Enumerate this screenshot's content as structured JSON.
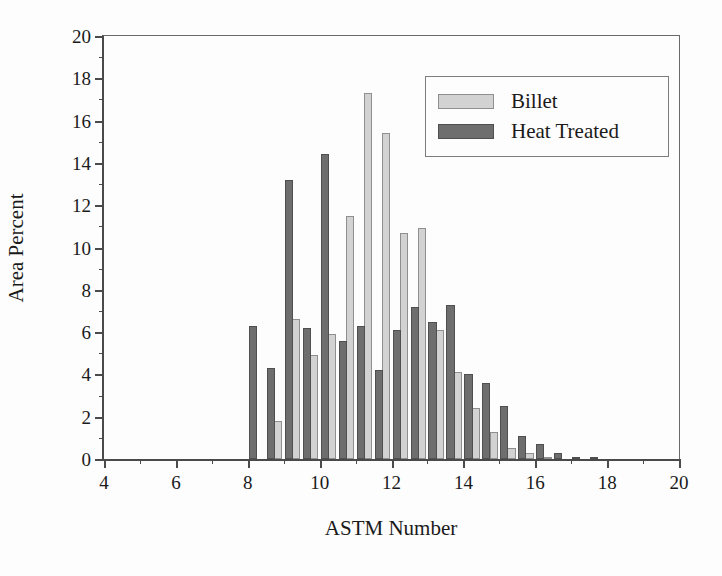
{
  "chart_data": {
    "type": "bar",
    "title": "",
    "xlabel": "ASTM Number",
    "ylabel": "Area Percent",
    "xlim": [
      4,
      20
    ],
    "ylim": [
      0,
      20
    ],
    "xticks": [
      4,
      6,
      8,
      10,
      12,
      14,
      16,
      18,
      20
    ],
    "xticklabels": [
      "4",
      "6",
      "8",
      "10",
      "12",
      "14",
      "16",
      "18",
      "20"
    ],
    "yticks": [
      0,
      2,
      4,
      6,
      8,
      10,
      12,
      14,
      16,
      18,
      20
    ],
    "yticklabels": [
      "0",
      "2",
      "4",
      "6",
      "8",
      "10",
      "12",
      "14",
      "16",
      "18",
      "20"
    ],
    "grid": false,
    "legend_position": "upper right",
    "bin_width": 0.5,
    "x": [
      8.25,
      8.75,
      9.25,
      9.75,
      10.25,
      10.75,
      11.25,
      11.75,
      12.25,
      12.75,
      13.25,
      13.75,
      14.25,
      14.75,
      15.25,
      15.75,
      16.25,
      16.75,
      17.25,
      17.75
    ],
    "series": [
      {
        "name": "Billet",
        "color": "#d2d2d2",
        "edge_color": "#8f8f8f",
        "values": [
          0.0,
          1.8,
          6.6,
          4.9,
          5.9,
          11.5,
          17.3,
          15.4,
          10.7,
          10.9,
          6.1,
          4.1,
          2.4,
          1.3,
          0.5,
          0.3,
          0.1,
          0.0,
          0.0,
          0.0
        ]
      },
      {
        "name": "Heat Treated",
        "color": "#6e6e6e",
        "edge_color": "#4f4f4f",
        "values": [
          6.3,
          4.3,
          13.2,
          6.2,
          14.4,
          5.6,
          6.3,
          4.2,
          6.1,
          7.2,
          6.5,
          7.3,
          4.0,
          3.6,
          2.5,
          1.1,
          0.7,
          0.3,
          0.1,
          0.05
        ]
      }
    ]
  },
  "axes": {
    "x_title": "ASTM Number",
    "y_title": "Area Percent"
  },
  "legend": {
    "entries": [
      {
        "label": "Billet",
        "swatch": "billet"
      },
      {
        "label": "Heat Treated",
        "swatch": "heat"
      }
    ]
  }
}
